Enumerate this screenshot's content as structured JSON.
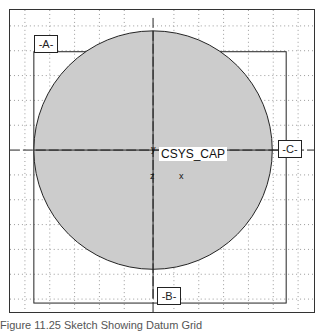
{
  "diagram": {
    "datums": {
      "a": "-A-",
      "b": "-B-",
      "c": "-C-"
    },
    "csys_label": "CSYS_CAP",
    "axis_labels": {
      "x": "x",
      "y": "y",
      "z": "z"
    },
    "colors": {
      "circle_fill": "#cccccc",
      "line": "#222222",
      "grid": "#999999",
      "background": "#ffffff"
    }
  },
  "caption": "Figure 11.25 Sketch Showing Datum Grid"
}
